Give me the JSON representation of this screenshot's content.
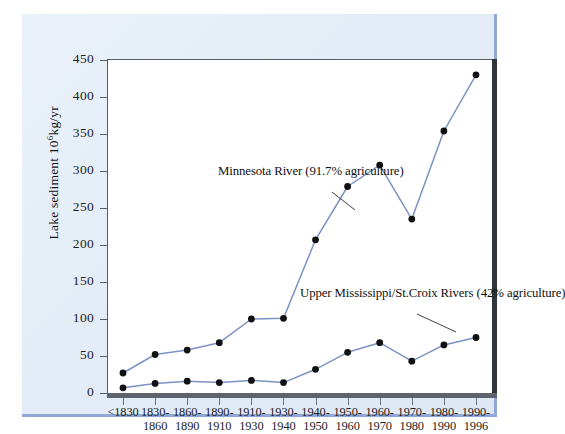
{
  "chart_data": {
    "type": "line",
    "title": "",
    "xlabel": "",
    "ylabel": "Lake sediment 10⁶kg/yr",
    "ylim": [
      0,
      450
    ],
    "yticks": [
      0,
      50,
      100,
      150,
      200,
      250,
      300,
      350,
      400,
      450
    ],
    "grid": false,
    "legend_position": "inline-annotations",
    "categories": [
      "<1830",
      "1830-1860",
      "1860-1890",
      "1890-1910",
      "1910-1930",
      "1930-1940",
      "1940-1950",
      "1950-1960",
      "1960-1970",
      "1970-1980",
      "1980-1990",
      "1990-1996"
    ],
    "category_lines": [
      [
        "<1830",
        ""
      ],
      [
        "1830-",
        "1860"
      ],
      [
        "1860-",
        "1890"
      ],
      [
        "1890-",
        "1910"
      ],
      [
        "1910-",
        "1930"
      ],
      [
        "1930-",
        "1940"
      ],
      [
        "1940-",
        "1950"
      ],
      [
        "1950-",
        "1960"
      ],
      [
        "1960-",
        "1970"
      ],
      [
        "1970-",
        "1980"
      ],
      [
        "1980-",
        "1990"
      ],
      [
        "1990-",
        "1996"
      ]
    ],
    "series": [
      {
        "name": "Minnesota River",
        "annotation_line1": "Minnesota River",
        "annotation_line2": "(91.7% agriculture)",
        "color": "#7b92c4",
        "marker_color": "#111111",
        "values": [
          27,
          52,
          58,
          68,
          100,
          101,
          207,
          279,
          308,
          235,
          354,
          430
        ]
      },
      {
        "name": "Upper Mississippi/St.Croix Rivers",
        "annotation_line1": "Upper Mississippi/St.Croix Rivers",
        "annotation_line2": "(42% agriculture)",
        "color": "#7b92c4",
        "marker_color": "#111111",
        "values": [
          7,
          13,
          16,
          14,
          17,
          14,
          32,
          55,
          68,
          43,
          65,
          75
        ]
      }
    ]
  },
  "colors": {
    "page_panel": "#e4edf7",
    "panel_border": "#8fa8d8",
    "plot_background": "#ffffff",
    "line": "#7b92c4",
    "marker": "#111111",
    "axis": "#555f6b",
    "axis_heavy": "#30353c"
  }
}
